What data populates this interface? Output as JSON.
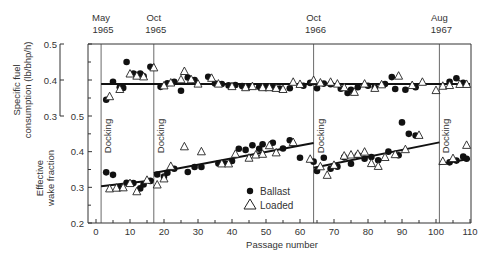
{
  "chart_data": {
    "type": "scatter",
    "title": "",
    "xlabel": "Passage number",
    "x_ticks": [
      0,
      10,
      20,
      30,
      40,
      50,
      60,
      70,
      80,
      90,
      100,
      110
    ],
    "xlim": [
      0,
      110
    ],
    "legend": [
      {
        "marker": "filled-circle",
        "label": "Ballast"
      },
      {
        "marker": "open-triangle",
        "label": "Loaded"
      }
    ],
    "events": [
      {
        "passage": 1.5,
        "label": "Docking",
        "date_top": "May",
        "date_bottom": "1965"
      },
      {
        "passage": 17,
        "label": "Docking",
        "date_top": "Oct",
        "date_bottom": "1965"
      },
      {
        "passage": 64,
        "label": "Docking",
        "date_top": "Oct",
        "date_bottom": "1966"
      },
      {
        "passage": 101,
        "label": "Docking",
        "date_top": "Aug",
        "date_bottom": "1967"
      }
    ],
    "panels": [
      {
        "name": "specific_fuel_consumption",
        "ylabel_line1": "Specific fuel",
        "ylabel_line2": "consumption (lb/bhp/h)",
        "ylim": [
          0.3,
          0.5
        ],
        "y_ticks": [
          "0.3",
          "0.4",
          "0.5"
        ],
        "trend": [
          {
            "x1": 1.5,
            "y1": 0.389,
            "x2": 110,
            "y2": 0.389
          }
        ],
        "series": [
          {
            "name": "Ballast",
            "points": [
              [
                3,
                0.345
              ],
              [
                5,
                0.395
              ],
              [
                7,
                0.38
              ],
              [
                8,
                0.378
              ],
              [
                9,
                0.45
              ],
              [
                11,
                0.418
              ],
              [
                13,
                0.418
              ],
              [
                14,
                0.41
              ],
              [
                16,
                0.437
              ],
              [
                19,
                0.381
              ],
              [
                21,
                0.391
              ],
              [
                23,
                0.395
              ],
              [
                25,
                0.37
              ],
              [
                27,
                0.407
              ],
              [
                29,
                0.4
              ],
              [
                33,
                0.409
              ],
              [
                35,
                0.39
              ],
              [
                37,
                0.389
              ],
              [
                39,
                0.385
              ],
              [
                41,
                0.386
              ],
              [
                43,
                0.383
              ],
              [
                45,
                0.382
              ],
              [
                48,
                0.381
              ],
              [
                50,
                0.378
              ],
              [
                52,
                0.378
              ],
              [
                54,
                0.376
              ],
              [
                57,
                0.377
              ],
              [
                61,
                0.384
              ],
              [
                63,
                0.392
              ],
              [
                65,
                0.377
              ],
              [
                67,
                0.39
              ],
              [
                69,
                0.388
              ],
              [
                72,
                0.376
              ],
              [
                74,
                0.364
              ],
              [
                75,
                0.373
              ],
              [
                77,
                0.38
              ],
              [
                80,
                0.384
              ],
              [
                82,
                0.38
              ],
              [
                85,
                0.389
              ],
              [
                87,
                0.408
              ],
              [
                88,
                0.375
              ],
              [
                91,
                0.373
              ],
              [
                94,
                0.38
              ],
              [
                104,
                0.395
              ],
              [
                106,
                0.405
              ],
              [
                108,
                0.392
              ]
            ]
          },
          {
            "name": "Loaded",
            "points": [
              [
                4,
                0.355
              ],
              [
                7,
                0.375
              ],
              [
                10,
                0.418
              ],
              [
                12,
                0.412
              ],
              [
                14,
                0.41
              ],
              [
                17,
                0.435
              ],
              [
                20,
                0.385
              ],
              [
                22,
                0.393
              ],
              [
                25,
                0.402
              ],
              [
                26,
                0.425
              ],
              [
                28,
                0.402
              ],
              [
                30,
                0.39
              ],
              [
                34,
                0.406
              ],
              [
                36,
                0.39
              ],
              [
                40,
                0.383
              ],
              [
                44,
                0.38
              ],
              [
                46,
                0.383
              ],
              [
                49,
                0.38
              ],
              [
                51,
                0.38
              ],
              [
                53,
                0.378
              ],
              [
                55,
                0.375
              ],
              [
                58,
                0.395
              ],
              [
                60,
                0.389
              ],
              [
                64,
                0.4
              ],
              [
                66,
                0.393
              ],
              [
                69,
                0.395
              ],
              [
                71,
                0.39
              ],
              [
                73,
                0.38
              ],
              [
                76,
                0.367
              ],
              [
                79,
                0.39
              ],
              [
                82,
                0.378
              ],
              [
                84,
                0.388
              ],
              [
                89,
                0.412
              ],
              [
                93,
                0.386
              ],
              [
                96,
                0.395
              ],
              [
                100,
                0.372
              ],
              [
                102,
                0.384
              ],
              [
                104,
                0.386
              ],
              [
                107,
                0.389
              ],
              [
                109,
                0.389
              ]
            ]
          }
        ]
      },
      {
        "name": "effective_wake_fraction",
        "ylabel_line1": "Effective",
        "ylabel_line2": "wake fraction",
        "ylim": [
          0.2,
          0.5
        ],
        "y_ticks": [
          "0.2",
          "0.3",
          "0.4",
          "0.5"
        ],
        "trend": [
          {
            "x1": 1.5,
            "y1": 0.303,
            "x2": 17,
            "y2": 0.32
          },
          {
            "x1": 17,
            "y1": 0.34,
            "x2": 64,
            "y2": 0.424
          },
          {
            "x1": 64,
            "y1": 0.355,
            "x2": 101,
            "y2": 0.426
          },
          {
            "x1": 101,
            "y1": 0.365,
            "x2": 110,
            "y2": 0.38
          }
        ],
        "series": [
          {
            "name": "Ballast",
            "points": [
              [
                3,
                0.342
              ],
              [
                5,
                0.335
              ],
              [
                7,
                0.298
              ],
              [
                9,
                0.313
              ],
              [
                11,
                0.312
              ],
              [
                13,
                0.297
              ],
              [
                14,
                0.308
              ],
              [
                16,
                0.318
              ],
              [
                18,
                0.336
              ],
              [
                20,
                0.33
              ],
              [
                21,
                0.341
              ],
              [
                23,
                0.352
              ],
              [
                27,
                0.343
              ],
              [
                29,
                0.357
              ],
              [
                31,
                0.357
              ],
              [
                36,
                0.367
              ],
              [
                38,
                0.367
              ],
              [
                40,
                0.374
              ],
              [
                42,
                0.408
              ],
              [
                44,
                0.405
              ],
              [
                46,
                0.418
              ],
              [
                48,
                0.408
              ],
              [
                49,
                0.421
              ],
              [
                52,
                0.425
              ],
              [
                55,
                0.409
              ],
              [
                57,
                0.432
              ],
              [
                60,
                0.383
              ],
              [
                64,
                0.372
              ],
              [
                65,
                0.346
              ],
              [
                67,
                0.383
              ],
              [
                69,
                0.352
              ],
              [
                71,
                0.358
              ],
              [
                73,
                0.384
              ],
              [
                75,
                0.366
              ],
              [
                77,
                0.39
              ],
              [
                79,
                0.38
              ],
              [
                81,
                0.385
              ],
              [
                83,
                0.376
              ],
              [
                86,
                0.4
              ],
              [
                89,
                0.39
              ],
              [
                90,
                0.482
              ],
              [
                92,
                0.45
              ],
              [
                94,
                0.445
              ],
              [
                104,
                0.37
              ],
              [
                106,
                0.375
              ],
              [
                108,
                0.386
              ],
              [
                109,
                0.38
              ]
            ]
          },
          {
            "name": "Loaded",
            "points": [
              [
                4,
                0.297
              ],
              [
                6,
                0.299
              ],
              [
                8,
                0.3
              ],
              [
                10,
                0.312
              ],
              [
                12,
                0.289
              ],
              [
                15,
                0.321
              ],
              [
                18,
                0.308
              ],
              [
                20,
                0.325
              ],
              [
                22,
                0.36
              ],
              [
                26,
                0.415
              ],
              [
                31,
                0.401
              ],
              [
                37,
                0.367
              ],
              [
                39,
                0.367
              ],
              [
                41,
                0.394
              ],
              [
                45,
                0.383
              ],
              [
                47,
                0.392
              ],
              [
                49,
                0.394
              ],
              [
                51,
                0.418
              ],
              [
                53,
                0.398
              ],
              [
                58,
                0.427
              ],
              [
                63,
                0.38
              ],
              [
                66,
                0.359
              ],
              [
                68,
                0.335
              ],
              [
                70,
                0.363
              ],
              [
                73,
                0.389
              ],
              [
                75,
                0.392
              ],
              [
                77,
                0.394
              ],
              [
                79,
                0.4
              ],
              [
                81,
                0.368
              ],
              [
                83,
                0.36
              ],
              [
                85,
                0.385
              ],
              [
                88,
                0.393
              ],
              [
                91,
                0.407
              ],
              [
                95,
                0.447
              ],
              [
                102,
                0.374
              ],
              [
                105,
                0.382
              ],
              [
                109,
                0.419
              ]
            ]
          }
        ]
      }
    ]
  },
  "legend_labels": {
    "ballast": "Ballast",
    "loaded": "Loaded"
  }
}
